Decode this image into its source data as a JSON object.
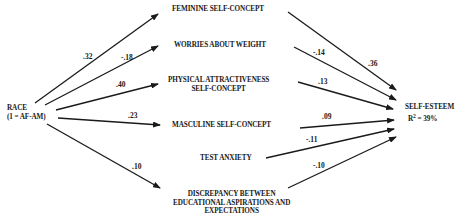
{
  "diagram": {
    "type": "path-model",
    "source": {
      "label_line1": "RACE",
      "label_line2": "(1 = AF-AM)"
    },
    "outcome": {
      "label": "SELF-ESTEEM",
      "r2_prefix": "R",
      "r2_sup": "2",
      "r2_value": " = 39%"
    },
    "mediators": [
      {
        "id": "feminine",
        "label_line1": "FEMININE SELF-CONCEPT",
        "race_path": ".32",
        "outcome_path": ".36"
      },
      {
        "id": "worries",
        "label_line1": "WORRIES ABOUT WEIGHT",
        "race_path": "-.18",
        "outcome_path": "-.14"
      },
      {
        "id": "physical",
        "label_line1": "PHYSICAL ATTRACTIVENESS",
        "label_line2": "SELF-CONCEPT",
        "race_path": ".40",
        "outcome_path": ".13"
      },
      {
        "id": "masculine",
        "label_line1": "MASCULINE SELF-CONCEPT",
        "race_path": ".23",
        "outcome_path": ".09"
      },
      {
        "id": "test-anxiety",
        "label_line1": "TEST ANXIETY",
        "outcome_path": "-.11"
      },
      {
        "id": "discrepancy",
        "label_line1": "DISCREPANCY BETWEEN",
        "label_line2": "EDUCATIONAL ASPIRATIONS AND",
        "label_line3": "EXPECTATIONS",
        "race_path": ".10",
        "outcome_path": "-.10"
      }
    ]
  }
}
